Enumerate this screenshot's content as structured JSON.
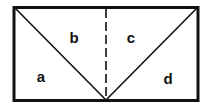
{
  "diagram": {
    "type": "rectangle-divided-into-triangles",
    "stroke_color": "#111111",
    "background": "#ffffff",
    "rectangle": {
      "x": 14,
      "y": 7,
      "width": 184,
      "height": 94
    },
    "apex": {
      "x": 106,
      "y": 101
    },
    "center_line": {
      "style": "dashed",
      "x": 106
    },
    "regions": [
      {
        "id": "a",
        "label": "a"
      },
      {
        "id": "b",
        "label": "b"
      },
      {
        "id": "c",
        "label": "c"
      },
      {
        "id": "d",
        "label": "d"
      }
    ]
  }
}
